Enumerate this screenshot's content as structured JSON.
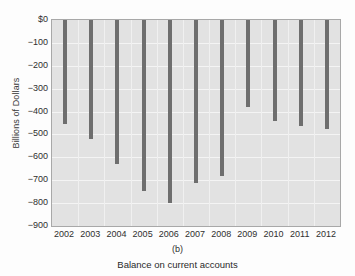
{
  "chart_data": {
    "type": "bar",
    "title": "",
    "panel_label": "(b)",
    "caption": "Balance on current accounts",
    "xlabel": "",
    "ylabel": "Billions of Dollars",
    "categories": [
      "2002",
      "2003",
      "2004",
      "2005",
      "2006",
      "2007",
      "2008",
      "2009",
      "2010",
      "2011",
      "2012"
    ],
    "values": [
      -455,
      -520,
      -630,
      -745,
      -800,
      -710,
      -680,
      -378,
      -442,
      -462,
      -475
    ],
    "ylim": [
      -900,
      0
    ],
    "ytick_labels": [
      "$0",
      "−100",
      "−200",
      "−300",
      "−400",
      "−500",
      "−600",
      "−700",
      "−800",
      "−900"
    ],
    "ytick_values": [
      0,
      -100,
      -200,
      -300,
      -400,
      -500,
      -600,
      -700,
      -800,
      -900
    ],
    "grid": true,
    "legend": null,
    "bar_color": "#6e6e6e",
    "plot_background": "#e2e2e2",
    "gridline_color": "#f4f4f4",
    "axis_color": "#a8a8a8"
  }
}
